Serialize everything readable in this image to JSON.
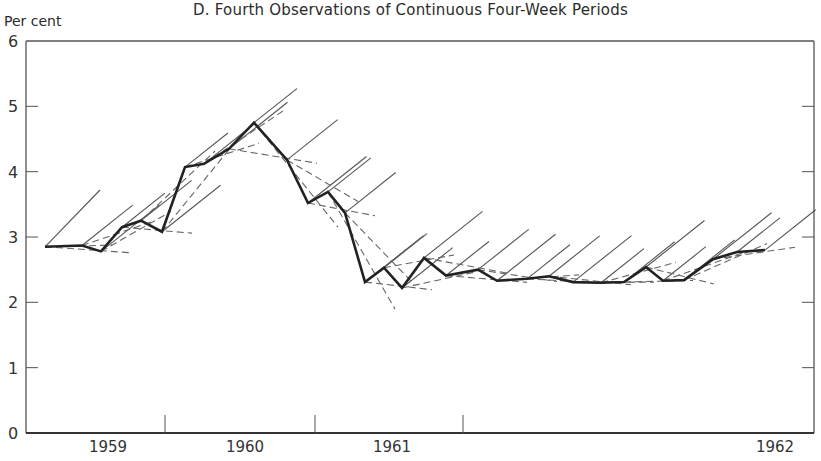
{
  "chart_data": {
    "type": "line",
    "title": "D.  Fourth Observations of Continuous Four-Week Periods",
    "ylabel": "Per cent",
    "xlabel": "",
    "ylim": [
      0,
      6
    ],
    "yticks": [
      0,
      1,
      2,
      3,
      4,
      5,
      6
    ],
    "year_labels": [
      "1959",
      "1960",
      "1961",
      "1962"
    ],
    "grid": false,
    "legend": null,
    "series": [
      {
        "name": "Observed (fourth observations)",
        "style": "thick-solid",
        "points": [
          [
            1958.75,
            2.85
          ],
          [
            1958.88,
            2.87
          ],
          [
            1958.95,
            2.78
          ],
          [
            1959.02,
            3.15
          ],
          [
            1959.08,
            3.25
          ],
          [
            1959.15,
            3.08
          ],
          [
            1959.24,
            4.07
          ],
          [
            1959.3,
            4.12
          ],
          [
            1959.38,
            4.35
          ],
          [
            1959.46,
            4.75
          ],
          [
            1959.57,
            4.18
          ],
          [
            1959.64,
            3.52
          ],
          [
            1959.71,
            3.69
          ],
          [
            1959.77,
            3.37
          ],
          [
            1959.83,
            2.31
          ],
          [
            1959.9,
            2.53
          ],
          [
            1959.96,
            2.22
          ],
          [
            1960.03,
            2.68
          ],
          [
            1960.1,
            2.41
          ],
          [
            1960.21,
            2.5
          ],
          [
            1960.28,
            2.33
          ],
          [
            1960.38,
            2.36
          ],
          [
            1960.45,
            2.4
          ],
          [
            1960.53,
            2.31
          ],
          [
            1960.62,
            2.3
          ],
          [
            1960.7,
            2.31
          ],
          [
            1960.78,
            2.54
          ],
          [
            1960.83,
            2.33
          ],
          [
            1960.9,
            2.34
          ],
          [
            1961.0,
            2.66
          ],
          [
            1961.08,
            2.77
          ],
          [
            1961.17,
            2.8
          ]
        ]
      }
    ]
  },
  "axis": {
    "y_tick_labels": [
      "0",
      "1",
      "2",
      "3",
      "4",
      "5",
      "6"
    ]
  }
}
